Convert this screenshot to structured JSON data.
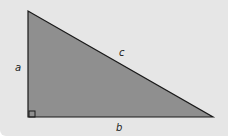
{
  "diagram": {
    "type": "right-triangle",
    "colors": {
      "background": "#e6e6e6",
      "fill": "#8f8f8f",
      "stroke": "#1a1a1a"
    },
    "vertices": {
      "top": [
        28,
        11
      ],
      "right_angle": [
        28,
        117
      ],
      "bottom_right": [
        213,
        117
      ]
    },
    "labels": {
      "a": "a",
      "b": "b",
      "c": "c"
    }
  }
}
